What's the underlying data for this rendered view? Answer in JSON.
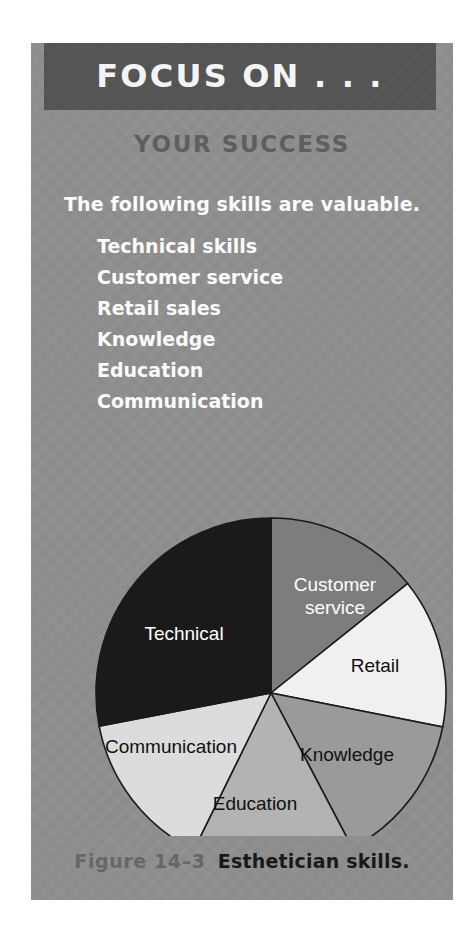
{
  "panel": {
    "header_title": "FOCUS ON . . .",
    "subtitle": "YOUR SUCCESS",
    "intro": "The following skills are valuable.",
    "skills": [
      "Technical skills",
      "Customer service",
      "Retail sales",
      "Knowledge",
      "Education",
      "Communication"
    ]
  },
  "caption": {
    "figure_number": "Figure 14–3",
    "figure_text": "Esthetician skills."
  },
  "colors": {
    "panel_background": "#8f8f8f",
    "header_bar": "#545454",
    "header_text": "#f4f4f4",
    "subtitle_text": "#5e5e5e",
    "list_text": "#fbfbfb",
    "caption_number": "#676767",
    "caption_text": "#191919",
    "slice_outline": "#1a1a1a"
  },
  "chart_data": {
    "type": "pie",
    "title": "Esthetician skills",
    "labels": [
      "Customer service",
      "Retail",
      "Knowledge",
      "Education",
      "Communication",
      "Technical"
    ],
    "values": [
      14.2,
      13.9,
      14.2,
      15.0,
      14.7,
      28.0
    ],
    "units": "percent",
    "start_angle_deg": 0,
    "direction": "clockwise",
    "legend": "none",
    "labels_inside_slices": true,
    "slices": [
      {
        "name": "Customer service",
        "value": 14.2,
        "start_deg": 0,
        "end_deg": 51.3,
        "color": "#7d7d7d",
        "label_color": "light",
        "label_lines": [
          "Customer",
          "service"
        ]
      },
      {
        "name": "Retail",
        "value": 13.9,
        "start_deg": 51.3,
        "end_deg": 101.2,
        "color": "#f0f0f0",
        "label_color": "dark",
        "label_lines": [
          "Retail"
        ]
      },
      {
        "name": "Knowledge",
        "value": 14.2,
        "start_deg": 101.2,
        "end_deg": 152.3,
        "color": "#9a9a9a",
        "label_color": "dark",
        "label_lines": [
          "Knowledge"
        ]
      },
      {
        "name": "Education",
        "value": 15.0,
        "start_deg": 152.3,
        "end_deg": 206.2,
        "color": "#b3b3b3",
        "label_color": "dark",
        "label_lines": [
          "Education"
        ]
      },
      {
        "name": "Communication",
        "value": 14.7,
        "start_deg": 206.2,
        "end_deg": 259.1,
        "color": "#dcdcdc",
        "label_color": "dark",
        "label_lines": [
          "Communication"
        ]
      },
      {
        "name": "Technical",
        "value": 28.0,
        "start_deg": 259.1,
        "end_deg": 360,
        "color": "#1a1a1a",
        "label_color": "light",
        "label_lines": [
          "Technical"
        ]
      }
    ],
    "label_positions": [
      {
        "name": "Customer service",
        "x": 304,
        "y": 543
      },
      {
        "name": "Retail",
        "x": 344,
        "y": 624
      },
      {
        "name": "Knowledge",
        "x": 316,
        "y": 713
      },
      {
        "name": "Education",
        "x": 224,
        "y": 762
      },
      {
        "name": "Communication",
        "x": 140,
        "y": 705
      },
      {
        "name": "Technical",
        "x": 153,
        "y": 592
      }
    ],
    "geometry": {
      "cx": 240,
      "cy": 650,
      "r": 175
    }
  }
}
